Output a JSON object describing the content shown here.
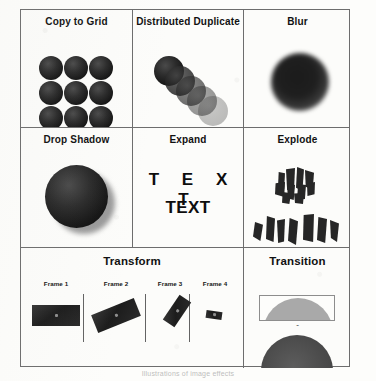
{
  "figure": {
    "caption": "Illustrations of image effects",
    "cells": [
      {
        "id": "copy-to-grid",
        "title": "Copy to Grid"
      },
      {
        "id": "distributed-duplicate",
        "title": "Distributed Duplicate"
      },
      {
        "id": "blur",
        "title": "Blur"
      },
      {
        "id": "drop-shadow",
        "title": "Drop Shadow"
      },
      {
        "id": "expand",
        "title": "Expand"
      },
      {
        "id": "explode",
        "title": "Explode"
      },
      {
        "id": "transform",
        "title": "Transform"
      },
      {
        "id": "transition",
        "title": "Transition"
      }
    ],
    "expand": {
      "spaced_text": "T E X T",
      "plain_text": "TEXT"
    },
    "transform": {
      "frames": [
        {
          "label": "Frame 1"
        },
        {
          "label": "Frame 2"
        },
        {
          "label": "Frame 3"
        },
        {
          "label": "Frame 4"
        }
      ]
    },
    "transition": {
      "marker": "ˇ"
    },
    "colors": {
      "border": "#6d6d6d",
      "sphere_dark": "#151515",
      "dome_light": "#a9a9a9",
      "dome_dark": "#4b4b4b",
      "paper": "#fcfcfa"
    }
  }
}
